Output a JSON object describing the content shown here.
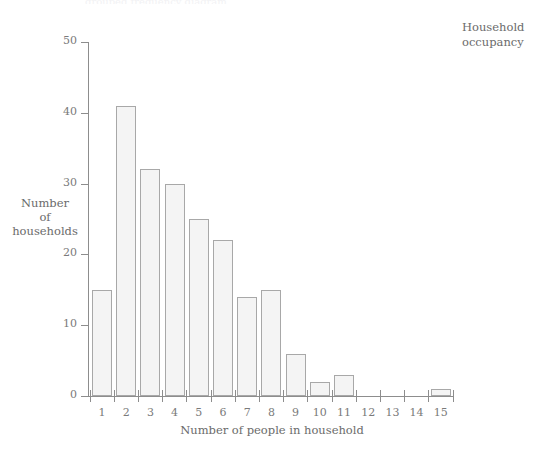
{
  "chart_title": "Household\noccupancy",
  "top_cropped_text": "grouped frequency diagram",
  "axes": {
    "y_label": "Number\nof\nhouseholds",
    "x_label": "Number of people in household",
    "y_ticks": [
      0,
      10,
      20,
      30,
      40,
      50
    ],
    "x_ticks": [
      1,
      2,
      3,
      4,
      5,
      6,
      7,
      8,
      9,
      10,
      11,
      12,
      13,
      14,
      15
    ]
  },
  "colors": {
    "bar_fill": "#f4f4f4",
    "bar_border": "#a8a8a8",
    "axis": "#8d8d8d",
    "text": "#6b6b6b",
    "background": "#ffffff"
  },
  "chart_data": {
    "type": "bar",
    "title": "Household occupancy",
    "xlabel": "Number of people in household",
    "ylabel": "Number of households",
    "categories": [
      "1",
      "2",
      "3",
      "4",
      "5",
      "6",
      "7",
      "8",
      "9",
      "10",
      "11",
      "12",
      "13",
      "14",
      "15"
    ],
    "values": [
      15,
      41,
      32,
      30,
      25,
      22,
      14,
      15,
      6,
      2,
      3,
      0,
      0,
      0,
      1
    ],
    "ylim": [
      0,
      50
    ],
    "ytick_step": 10,
    "grid": false,
    "legend": null
  }
}
